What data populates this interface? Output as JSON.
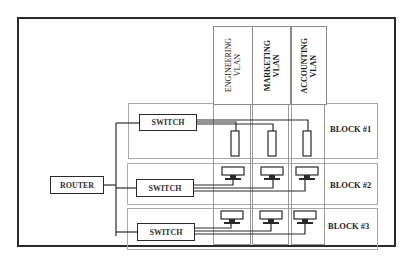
{
  "diagram": {
    "title": "",
    "router": {
      "label": "ROUTER"
    },
    "switches": [
      {
        "label": "SWITCH",
        "block": "BLOCK #1"
      },
      {
        "label": "SWITCH",
        "block": "BLOCK #2"
      },
      {
        "label": "SWITCH",
        "block": "BLOCK #3"
      }
    ],
    "vlans": [
      {
        "line1": "ENGINEERING",
        "line2": "VLAN"
      },
      {
        "line1": "MARKETING",
        "line2": "VLAN"
      },
      {
        "line1": "ACCOUNTING",
        "line2": "VLAN"
      }
    ],
    "blocks": [
      {
        "label": "BLOCK #1",
        "device_type": "server"
      },
      {
        "label": "BLOCK #2",
        "device_type": "workstation"
      },
      {
        "label": "BLOCK #3",
        "device_type": "workstation"
      }
    ],
    "colors": {
      "line": "#2a2a2a",
      "grid": "#a8a8a8",
      "background": "#ffffff"
    }
  }
}
